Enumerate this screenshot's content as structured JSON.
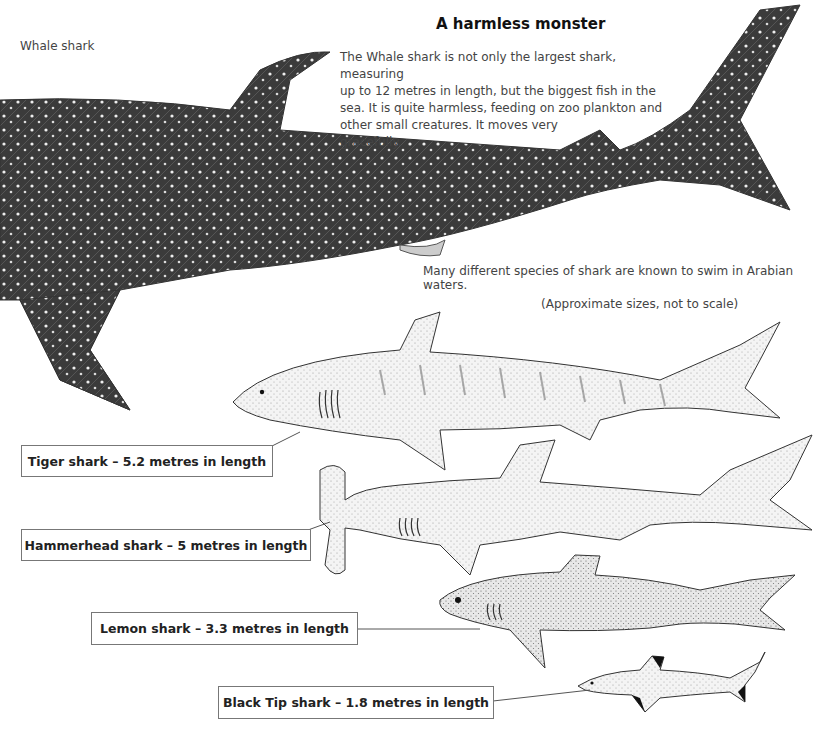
{
  "page": {
    "title": "A harmless monster",
    "whale_label": "Whale shark",
    "description": [
      "The Whale shark is not only the largest shark, measuring",
      "up to 12 metres in length, but the biggest fish in the",
      "sea. It is quite harmless, feeding on zoo plankton and",
      "other small creatures. It moves very",
      "gracefully."
    ],
    "intro": "Many different species of shark are known to swim in Arabian waters.",
    "scale_note": "(Approximate sizes, not to scale)"
  },
  "sharks": [
    {
      "name": "Tiger shark",
      "length_m": 5.2,
      "label": "Tiger shark – 5.2 metres in length"
    },
    {
      "name": "Hammerhead shark",
      "length_m": 5,
      "label": "Hammerhead shark – 5 metres in length"
    },
    {
      "name": "Lemon shark",
      "length_m": 3.3,
      "label": "Lemon shark – 3.3 metres in length"
    },
    {
      "name": "Black Tip shark",
      "length_m": 1.8,
      "label": "Black Tip shark – 1.8 metres in length"
    }
  ],
  "colors": {
    "ink": "#222222",
    "whale_body": "#3a3a3a",
    "shark_fill": "#ececec",
    "border": "#777777"
  }
}
